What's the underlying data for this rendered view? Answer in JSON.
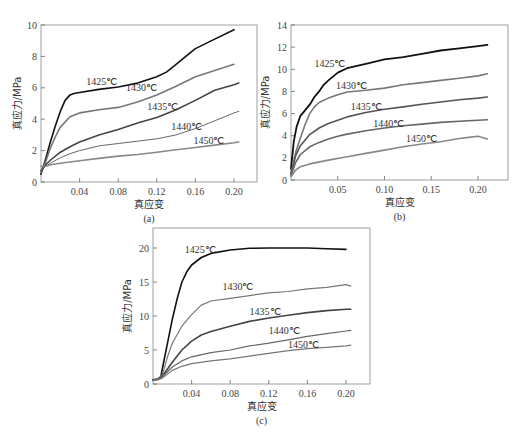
{
  "chart_data": [
    {
      "id": "a",
      "type": "line",
      "panel_label": "(a)",
      "xlabel": "真应变",
      "ylabel": "真应力/MPa",
      "xlim": [
        0,
        0.224
      ],
      "ylim": [
        0,
        10
      ],
      "xticks": [
        0.04,
        0.08,
        0.12,
        0.16,
        0.2
      ],
      "xtick_labels": [
        "0.04",
        "0.08",
        "0.12",
        "0.16",
        "0.20"
      ],
      "yticks": [
        0,
        2,
        4,
        6,
        8,
        10
      ],
      "ytick_labels": [
        "0",
        "2",
        "4",
        "6",
        "8",
        "10"
      ],
      "grid": false,
      "legend": "inline labels",
      "series": [
        {
          "name": "1425℃",
          "color": "#111111",
          "width": 1.6,
          "label_pos": [
            0.047,
            6.2
          ],
          "x": [
            0,
            0.005,
            0.01,
            0.015,
            0.02,
            0.025,
            0.03,
            0.035,
            0.04,
            0.06,
            0.08,
            0.1,
            0.12,
            0.13,
            0.14,
            0.15,
            0.16,
            0.18,
            0.2
          ],
          "y": [
            0.5,
            1.5,
            2.6,
            3.6,
            4.5,
            5.2,
            5.55,
            5.65,
            5.7,
            5.9,
            6.05,
            6.3,
            6.7,
            7.0,
            7.5,
            8.0,
            8.5,
            9.1,
            9.7
          ]
        },
        {
          "name": "1430℃",
          "color": "#777777",
          "width": 1.6,
          "label_pos": [
            0.088,
            5.8
          ],
          "x": [
            0,
            0.005,
            0.01,
            0.015,
            0.02,
            0.03,
            0.04,
            0.06,
            0.08,
            0.1,
            0.12,
            0.14,
            0.16,
            0.18,
            0.2
          ],
          "y": [
            0.6,
            1.3,
            2.2,
            2.9,
            3.5,
            4.15,
            4.4,
            4.6,
            4.75,
            5.1,
            5.55,
            6.1,
            6.7,
            7.1,
            7.5
          ]
        },
        {
          "name": "1435℃",
          "color": "#444444",
          "width": 1.6,
          "label_pos": [
            0.11,
            4.6
          ],
          "x": [
            0,
            0.005,
            0.01,
            0.02,
            0.03,
            0.04,
            0.06,
            0.08,
            0.1,
            0.12,
            0.14,
            0.16,
            0.18,
            0.2,
            0.205
          ],
          "y": [
            0.7,
            1.1,
            1.4,
            1.9,
            2.25,
            2.55,
            3.0,
            3.35,
            3.75,
            4.1,
            4.6,
            5.2,
            5.85,
            6.2,
            6.3
          ]
        },
        {
          "name": "1440℃",
          "color": "#666666",
          "width": 1.0,
          "label_pos": [
            0.135,
            3.3
          ],
          "x": [
            0,
            0.01,
            0.02,
            0.03,
            0.04,
            0.06,
            0.08,
            0.1,
            0.12,
            0.14,
            0.16,
            0.18,
            0.2,
            0.205
          ],
          "y": [
            0.8,
            1.2,
            1.55,
            1.8,
            2.0,
            2.3,
            2.45,
            2.6,
            2.75,
            3.0,
            3.4,
            3.9,
            4.4,
            4.5
          ]
        },
        {
          "name": "1450℃",
          "color": "#888888",
          "width": 1.6,
          "label_pos": [
            0.158,
            2.4
          ],
          "x": [
            0,
            0.005,
            0.01,
            0.02,
            0.04,
            0.06,
            0.08,
            0.1,
            0.12,
            0.14,
            0.16,
            0.18,
            0.2,
            0.205
          ],
          "y": [
            1.0,
            1.0,
            1.1,
            1.2,
            1.35,
            1.5,
            1.65,
            1.75,
            1.9,
            2.05,
            2.2,
            2.35,
            2.5,
            2.55
          ]
        }
      ]
    },
    {
      "id": "b",
      "type": "line",
      "panel_label": "(b)",
      "xlabel": "真应变",
      "ylabel": "真应力/MPa",
      "xlim": [
        0,
        0.232
      ],
      "ylim": [
        0,
        14
      ],
      "xticks": [
        0.05,
        0.1,
        0.15,
        0.2
      ],
      "xtick_labels": [
        "0.05",
        "0.10",
        "0.15",
        "0.20"
      ],
      "yticks": [
        0,
        2,
        4,
        6,
        8,
        10,
        12,
        14
      ],
      "ytick_labels": [
        "0",
        "2",
        "4",
        "6",
        "8",
        "10",
        "12",
        "14"
      ],
      "grid": false,
      "legend": "inline labels",
      "series": [
        {
          "name": "1425℃",
          "color": "#111111",
          "width": 1.8,
          "label_pos": [
            0.025,
            10.2
          ],
          "x": [
            0,
            0.003,
            0.006,
            0.01,
            0.015,
            0.02,
            0.025,
            0.03,
            0.035,
            0.04,
            0.05,
            0.06,
            0.08,
            0.1,
            0.12,
            0.14,
            0.16,
            0.18,
            0.2,
            0.21
          ],
          "y": [
            1.0,
            3.5,
            4.8,
            5.8,
            6.3,
            6.8,
            7.5,
            8.0,
            8.6,
            9.0,
            9.7,
            10.1,
            10.5,
            10.9,
            11.1,
            11.4,
            11.7,
            11.9,
            12.1,
            12.2
          ]
        },
        {
          "name": "1430℃",
          "color": "#777777",
          "width": 1.6,
          "label_pos": [
            0.048,
            8.2
          ],
          "x": [
            0,
            0.005,
            0.01,
            0.015,
            0.02,
            0.025,
            0.03,
            0.04,
            0.05,
            0.06,
            0.08,
            0.1,
            0.12,
            0.14,
            0.16,
            0.18,
            0.2,
            0.21
          ],
          "y": [
            0.6,
            2.5,
            3.8,
            5.0,
            6.0,
            6.6,
            7.0,
            7.4,
            7.7,
            7.95,
            8.1,
            8.3,
            8.6,
            8.8,
            9.0,
            9.2,
            9.4,
            9.6
          ]
        },
        {
          "name": "1435℃",
          "color": "#555555",
          "width": 1.6,
          "label_pos": [
            0.064,
            6.3
          ],
          "x": [
            0,
            0.005,
            0.01,
            0.02,
            0.03,
            0.04,
            0.05,
            0.06,
            0.08,
            0.1,
            0.12,
            0.14,
            0.16,
            0.18,
            0.2,
            0.21
          ],
          "y": [
            0.5,
            2.2,
            3.1,
            4.1,
            4.7,
            5.1,
            5.4,
            5.7,
            6.1,
            6.4,
            6.6,
            6.85,
            7.05,
            7.25,
            7.4,
            7.5
          ]
        },
        {
          "name": "1440℃",
          "color": "#666666",
          "width": 1.6,
          "label_pos": [
            0.088,
            4.8
          ],
          "x": [
            0,
            0.005,
            0.01,
            0.02,
            0.03,
            0.04,
            0.05,
            0.06,
            0.08,
            0.1,
            0.12,
            0.14,
            0.16,
            0.18,
            0.2,
            0.21
          ],
          "y": [
            0.4,
            1.6,
            2.3,
            3.0,
            3.4,
            3.7,
            3.95,
            4.15,
            4.45,
            4.7,
            4.9,
            5.05,
            5.2,
            5.3,
            5.4,
            5.45
          ]
        },
        {
          "name": "1450℃",
          "color": "#888888",
          "width": 1.6,
          "label_pos": [
            0.123,
            3.4
          ],
          "x": [
            0,
            0.005,
            0.01,
            0.02,
            0.04,
            0.06,
            0.08,
            0.1,
            0.12,
            0.14,
            0.16,
            0.18,
            0.19,
            0.2,
            0.21
          ],
          "y": [
            0.3,
            0.9,
            1.2,
            1.45,
            1.8,
            2.1,
            2.4,
            2.7,
            3.0,
            3.25,
            3.45,
            3.75,
            3.85,
            3.95,
            3.7
          ]
        }
      ]
    },
    {
      "id": "c",
      "type": "line",
      "panel_label": "(c)",
      "xlabel": "真应变",
      "ylabel": "真应力/MPa",
      "xlim": [
        0,
        0.225
      ],
      "ylim": [
        0,
        22.9
      ],
      "xticks": [
        0.04,
        0.08,
        0.12,
        0.16,
        0.2
      ],
      "xtick_labels": [
        "0.04",
        "0.08",
        "0.12",
        "0.16",
        "0.20"
      ],
      "yticks": [
        0,
        5,
        10,
        15,
        20
      ],
      "ytick_labels": [
        "0",
        "5",
        "10",
        "15",
        "20"
      ],
      "grid": false,
      "legend": "inline labels",
      "series": [
        {
          "name": "1425℃",
          "color": "#111111",
          "width": 1.6,
          "label_pos": [
            0.033,
            19.3
          ],
          "x": [
            0,
            0.005,
            0.008,
            0.01,
            0.015,
            0.02,
            0.025,
            0.03,
            0.035,
            0.04,
            0.05,
            0.06,
            0.08,
            0.1,
            0.12,
            0.14,
            0.16,
            0.18,
            0.2
          ],
          "y": [
            0.6,
            0.7,
            1.0,
            2.5,
            6.0,
            9.5,
            12.5,
            15.0,
            16.5,
            17.5,
            18.6,
            19.2,
            19.7,
            19.95,
            20.0,
            20.0,
            20.0,
            19.9,
            19.8
          ]
        },
        {
          "name": "1430℃",
          "color": "#777777",
          "width": 1.2,
          "label_pos": [
            0.072,
            13.8
          ],
          "x": [
            0,
            0.005,
            0.01,
            0.015,
            0.02,
            0.03,
            0.04,
            0.05,
            0.06,
            0.08,
            0.1,
            0.12,
            0.14,
            0.16,
            0.18,
            0.2,
            0.205
          ],
          "y": [
            0.6,
            0.7,
            1.5,
            4.0,
            6.0,
            8.5,
            10.2,
            11.6,
            12.2,
            12.6,
            13.0,
            13.4,
            13.6,
            14.0,
            14.2,
            14.6,
            14.4
          ]
        },
        {
          "name": "1435℃",
          "color": "#444444",
          "width": 1.6,
          "label_pos": [
            0.1,
            10.2
          ],
          "x": [
            0,
            0.005,
            0.01,
            0.02,
            0.03,
            0.04,
            0.05,
            0.06,
            0.08,
            0.1,
            0.12,
            0.14,
            0.16,
            0.18,
            0.2,
            0.205
          ],
          "y": [
            0.6,
            0.7,
            1.2,
            3.2,
            5.0,
            6.3,
            7.2,
            7.7,
            8.5,
            9.2,
            9.7,
            10.1,
            10.5,
            10.8,
            11.0,
            11.0
          ]
        },
        {
          "name": "1440℃",
          "color": "#666666",
          "width": 1.2,
          "label_pos": [
            0.12,
            7.3
          ],
          "x": [
            0,
            0.005,
            0.01,
            0.02,
            0.03,
            0.04,
            0.06,
            0.08,
            0.1,
            0.12,
            0.14,
            0.16,
            0.18,
            0.2,
            0.205
          ],
          "y": [
            0.6,
            0.7,
            1.1,
            2.5,
            3.4,
            4.0,
            4.6,
            5.0,
            5.6,
            6.0,
            6.5,
            7.0,
            7.4,
            7.8,
            7.9
          ]
        },
        {
          "name": "1450℃",
          "color": "#777777",
          "width": 1.2,
          "label_pos": [
            0.14,
            5.3
          ],
          "x": [
            0,
            0.005,
            0.01,
            0.02,
            0.03,
            0.04,
            0.06,
            0.08,
            0.1,
            0.12,
            0.14,
            0.16,
            0.18,
            0.2,
            0.205
          ],
          "y": [
            0.5,
            0.6,
            0.9,
            2.0,
            2.6,
            3.0,
            3.4,
            3.7,
            4.1,
            4.5,
            4.9,
            5.2,
            5.4,
            5.6,
            5.7
          ]
        }
      ]
    }
  ],
  "layout": {
    "panels": {
      "a": {
        "left": 41,
        "right": 257,
        "top": 25,
        "bottom": 182,
        "x0": 41,
        "xscale": 965,
        "yscale": 15.7
      },
      "b": {
        "left": 291,
        "right": 508,
        "top": 25,
        "bottom": 180,
        "x0": 291,
        "xscale": 935,
        "yscale": 11.07
      },
      "c": {
        "left": 153,
        "right": 370,
        "top": 228,
        "bottom": 384,
        "x0": 153,
        "xscale": 965,
        "yscale": 6.8
      }
    }
  }
}
